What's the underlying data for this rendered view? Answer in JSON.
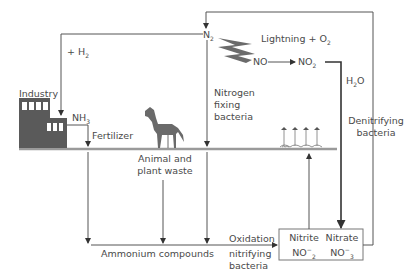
{
  "diagram": {
    "labels": {
      "n2": "N",
      "n2_sub": "2",
      "h2": "+ H",
      "h2_sub": "2",
      "lightning": "Lightning + O",
      "lightning_sub": "2",
      "no": "NO",
      "no2": "NO",
      "no2_sub": "2",
      "h2o_pre": "H",
      "h2o_sub": "2",
      "h2o_post": "O",
      "industry": "Industry",
      "nh3": "NH",
      "nh3_sub": "3",
      "fertilizer": "Fertilizer",
      "nitrogen_fixing_1": "Nitrogen",
      "nitrogen_fixing_2": "fixing",
      "nitrogen_fixing_3": "bacteria",
      "denitrifying_1": "Denitrifying",
      "denitrifying_2": "bacteria",
      "waste_1": "Animal and",
      "waste_2": "plant waste",
      "ammonium": "Ammonium compounds",
      "oxidation": "Oxidation",
      "nitrifying_1": "nitrifying",
      "nitrifying_2": "bacteria",
      "nitrite": "Nitrite",
      "nitrite_formula": "NO",
      "nitrite_sub": "2",
      "nitrite_sup": "−",
      "nitrate": "Nitrate",
      "nitrate_formula": "NO",
      "nitrate_sub": "3",
      "nitrate_sup": "−"
    },
    "colors": {
      "line": "#555555",
      "ground": "#9a9a9a",
      "factory": "#5a5a5a",
      "lightning": "#6b6b6b",
      "horse": "#6a6a6a",
      "text": "#4a4a4a"
    }
  }
}
